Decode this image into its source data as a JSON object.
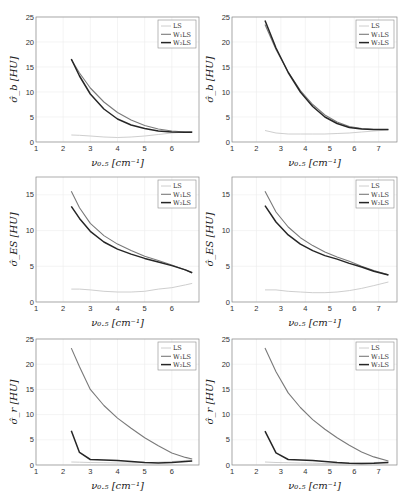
{
  "legend_labels": [
    "LS",
    "W₁LS",
    "W₂LS"
  ],
  "series_colors": {
    "LS": "#c8c8c8",
    "W1LS": "#7a7a7a",
    "W2LS": "#262626"
  },
  "chart_data": [
    {
      "id": "row1-left",
      "type": "line",
      "title": "",
      "xlabel": "ν₀.₅ [cm⁻¹]",
      "ylabel": "σ̂_b [HU]",
      "xlim": [
        1,
        7
      ],
      "ylim": [
        0,
        25
      ],
      "xticks": [
        1,
        2,
        3,
        4,
        5,
        6
      ],
      "yticks": [
        0,
        5,
        10,
        15,
        20,
        25
      ],
      "grid": true,
      "legend_position": "upper right",
      "x": [
        2.3,
        2.6,
        3.0,
        3.5,
        4.0,
        4.5,
        5.0,
        5.5,
        6.0,
        6.5,
        6.75
      ],
      "series": [
        {
          "name": "LS",
          "values": [
            1.4,
            1.35,
            1.2,
            1.0,
            0.9,
            1.0,
            1.2,
            1.5,
            1.8,
            2.0,
            2.1
          ]
        },
        {
          "name": "W1LS",
          "values": [
            16.5,
            13.8,
            10.8,
            8.0,
            5.9,
            4.4,
            3.3,
            2.6,
            2.2,
            2.0,
            2.0
          ]
        },
        {
          "name": "W2LS",
          "values": [
            16.6,
            13.2,
            9.6,
            6.6,
            4.6,
            3.4,
            2.7,
            2.2,
            2.0,
            1.95,
            1.95
          ]
        }
      ]
    },
    {
      "id": "row1-right",
      "type": "line",
      "title": "",
      "xlabel": "ν₀.₅ [cm⁻¹]",
      "ylabel": "σ̂_b [HU]",
      "xlim": [
        1,
        7.75
      ],
      "ylim": [
        0,
        25
      ],
      "xticks": [
        1,
        2,
        3,
        4,
        5,
        6,
        7
      ],
      "yticks": [
        0,
        5,
        10,
        15,
        20,
        25
      ],
      "grid": true,
      "legend_position": "upper right",
      "x": [
        2.35,
        2.8,
        3.3,
        3.8,
        4.3,
        4.8,
        5.3,
        5.8,
        6.3,
        6.8,
        7.4
      ],
      "series": [
        {
          "name": "LS",
          "values": [
            2.3,
            1.8,
            1.6,
            1.6,
            1.6,
            1.6,
            1.7,
            1.8,
            2.0,
            2.2,
            2.4
          ]
        },
        {
          "name": "W1LS",
          "values": [
            23.5,
            18.5,
            14.0,
            10.3,
            7.5,
            5.4,
            4.0,
            3.1,
            2.7,
            2.5,
            2.5
          ]
        },
        {
          "name": "W2LS",
          "values": [
            24.3,
            18.8,
            13.9,
            10.0,
            7.1,
            5.0,
            3.7,
            2.9,
            2.6,
            2.5,
            2.5
          ]
        }
      ]
    },
    {
      "id": "row2-left",
      "type": "line",
      "title": "",
      "xlabel": "ν₀.₅ [cm⁻¹]",
      "ylabel": "σ̂_ES [HU]",
      "xlim": [
        1,
        7
      ],
      "ylim": [
        0,
        17.5
      ],
      "xticks": [
        1,
        2,
        3,
        4,
        5,
        6
      ],
      "yticks": [
        0,
        5,
        10,
        15
      ],
      "grid": true,
      "legend_position": "upper right",
      "x": [
        2.3,
        2.6,
        3.0,
        3.5,
        4.0,
        4.5,
        5.0,
        5.5,
        6.0,
        6.5,
        6.75
      ],
      "series": [
        {
          "name": "LS",
          "values": [
            1.8,
            1.8,
            1.7,
            1.5,
            1.4,
            1.4,
            1.5,
            1.8,
            2.0,
            2.4,
            2.6
          ]
        },
        {
          "name": "W1LS",
          "values": [
            15.5,
            13.2,
            11.0,
            9.3,
            8.1,
            7.2,
            6.4,
            5.8,
            5.2,
            4.5,
            4.1
          ]
        },
        {
          "name": "W2LS",
          "values": [
            13.4,
            11.7,
            9.9,
            8.4,
            7.4,
            6.7,
            6.1,
            5.6,
            5.1,
            4.5,
            4.1
          ]
        }
      ]
    },
    {
      "id": "row2-right",
      "type": "line",
      "title": "",
      "xlabel": "ν₀.₅ [cm⁻¹]",
      "ylabel": "σ̂_ES [HU]",
      "xlim": [
        1,
        7.75
      ],
      "ylim": [
        0,
        17.5
      ],
      "xticks": [
        1,
        2,
        3,
        4,
        5,
        6,
        7
      ],
      "yticks": [
        0,
        5,
        10,
        15
      ],
      "grid": true,
      "legend_position": "upper right",
      "x": [
        2.35,
        2.8,
        3.3,
        3.8,
        4.3,
        4.8,
        5.3,
        5.8,
        6.3,
        6.8,
        7.4
      ],
      "series": [
        {
          "name": "LS",
          "values": [
            1.7,
            1.7,
            1.5,
            1.4,
            1.3,
            1.3,
            1.4,
            1.6,
            1.9,
            2.3,
            2.8
          ]
        },
        {
          "name": "W1LS",
          "values": [
            15.5,
            12.6,
            10.5,
            9.0,
            7.9,
            7.0,
            6.3,
            5.7,
            5.0,
            4.4,
            3.8
          ]
        },
        {
          "name": "W2LS",
          "values": [
            13.5,
            11.2,
            9.4,
            8.1,
            7.2,
            6.5,
            6.0,
            5.4,
            4.9,
            4.3,
            3.8
          ]
        }
      ]
    },
    {
      "id": "row3-left",
      "type": "line",
      "title": "",
      "xlabel": "ν₀.₅ [cm⁻¹]",
      "ylabel": "σ̂_r [HU]",
      "xlim": [
        1,
        7
      ],
      "ylim": [
        0,
        25
      ],
      "xticks": [
        1,
        2,
        3,
        4,
        5,
        6
      ],
      "yticks": [
        0,
        5,
        10,
        15,
        20,
        25
      ],
      "grid": true,
      "legend_position": "upper right",
      "x": [
        2.3,
        2.6,
        3.0,
        3.5,
        4.0,
        4.5,
        5.0,
        5.5,
        6.0,
        6.5,
        6.75
      ],
      "series": [
        {
          "name": "LS",
          "values": [
            0.6,
            0.55,
            0.5,
            0.45,
            0.4,
            0.4,
            0.45,
            0.55,
            0.7,
            0.9,
            1.0
          ]
        },
        {
          "name": "W1LS",
          "values": [
            23.2,
            19.5,
            15.0,
            11.8,
            9.3,
            7.3,
            5.4,
            3.8,
            2.4,
            1.5,
            1.2
          ]
        },
        {
          "name": "W2LS",
          "values": [
            6.8,
            2.5,
            1.1,
            1.0,
            0.9,
            0.7,
            0.5,
            0.4,
            0.5,
            0.7,
            0.8
          ]
        }
      ]
    },
    {
      "id": "row3-right",
      "type": "line",
      "title": "",
      "xlabel": "ν₀.₅ [cm⁻¹]",
      "ylabel": "σ̂_r [HU]",
      "xlim": [
        1,
        7.75
      ],
      "ylim": [
        0,
        25
      ],
      "xticks": [
        1,
        2,
        3,
        4,
        5,
        6,
        7
      ],
      "yticks": [
        0,
        5,
        10,
        15,
        20,
        25
      ],
      "grid": true,
      "legend_position": "upper right",
      "x": [
        2.35,
        2.8,
        3.3,
        3.8,
        4.3,
        4.8,
        5.3,
        5.8,
        6.3,
        6.8,
        7.4
      ],
      "series": [
        {
          "name": "LS",
          "values": [
            0.6,
            0.5,
            0.45,
            0.4,
            0.35,
            0.3,
            0.3,
            0.35,
            0.4,
            0.5,
            0.6
          ]
        },
        {
          "name": "W1LS",
          "values": [
            23.2,
            18.5,
            14.3,
            11.4,
            9.0,
            7.1,
            5.4,
            3.9,
            2.6,
            1.6,
            0.8
          ]
        },
        {
          "name": "W2LS",
          "values": [
            6.7,
            2.4,
            1.1,
            1.0,
            0.9,
            0.7,
            0.5,
            0.35,
            0.3,
            0.35,
            0.5
          ]
        }
      ]
    }
  ]
}
